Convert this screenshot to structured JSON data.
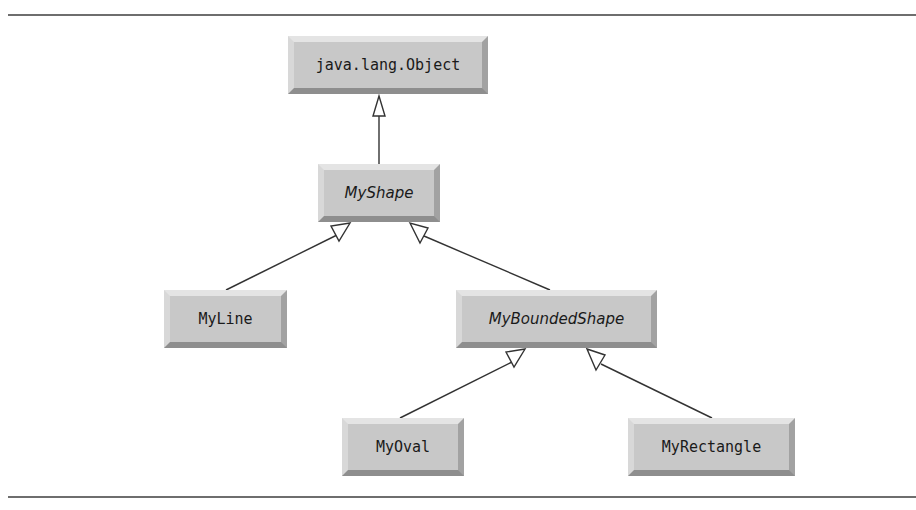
{
  "diagram": {
    "type": "uml-class-hierarchy",
    "nodes": {
      "object": {
        "label": "java.lang.Object",
        "abstract": false
      },
      "myshape": {
        "label": "MyShape",
        "abstract": true
      },
      "myline": {
        "label": "MyLine",
        "abstract": false
      },
      "myboundedshape": {
        "label": "MyBoundedShape",
        "abstract": true
      },
      "myoval": {
        "label": "MyOval",
        "abstract": false
      },
      "myrectangle": {
        "label": "MyRectangle",
        "abstract": false
      }
    },
    "edges": [
      {
        "from": "MyShape",
        "to": "java.lang.Object",
        "kind": "generalization"
      },
      {
        "from": "MyLine",
        "to": "MyShape",
        "kind": "generalization"
      },
      {
        "from": "MyBoundedShape",
        "to": "MyShape",
        "kind": "generalization"
      },
      {
        "from": "MyOval",
        "to": "MyBoundedShape",
        "kind": "generalization"
      },
      {
        "from": "MyRectangle",
        "to": "MyBoundedShape",
        "kind": "generalization"
      }
    ],
    "colors": {
      "box_fill": "#c8c8c8",
      "box_highlight": "#e4e4e4",
      "box_shadow": "#8e8e8e",
      "line": "#333333",
      "rule": "#6e6e6e"
    }
  }
}
